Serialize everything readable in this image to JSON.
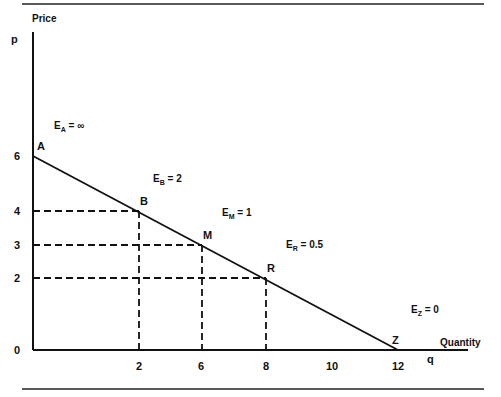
{
  "chart_data": {
    "type": "line",
    "title": "",
    "xlabel": "Quantity",
    "xlabel_symbol": "q",
    "ylabel": "Price",
    "ylabel_symbol": "p",
    "grid": false,
    "x_ticks": [
      {
        "label": "2",
        "slot": 2
      },
      {
        "label": "6",
        "slot": 4
      },
      {
        "label": "8",
        "slot": 6
      },
      {
        "label": "10",
        "slot": 8
      },
      {
        "label": "12",
        "slot": 10
      }
    ],
    "origin_label": "0",
    "y_ticks": [
      {
        "label": "2",
        "value": 2
      },
      {
        "label": "3",
        "value": 3
      },
      {
        "label": "4",
        "value": 4
      },
      {
        "label": "6",
        "value": 6
      }
    ],
    "series": [
      {
        "name": "Linear demand curve",
        "points": [
          {
            "name": "A",
            "x_slot": 0,
            "y": 6
          },
          {
            "name": "Z",
            "x_slot": 10,
            "y": 0
          }
        ]
      }
    ],
    "points": [
      {
        "name": "A",
        "x_slot": 0,
        "y": 6,
        "dashed": false
      },
      {
        "name": "B",
        "x_slot": 2,
        "y": 4,
        "dashed": true
      },
      {
        "name": "M",
        "x_slot": 4,
        "y": 3,
        "dashed": true
      },
      {
        "name": "R",
        "x_slot": 6,
        "y": 2,
        "dashed": true
      },
      {
        "name": "Z",
        "x_slot": 10,
        "y": 0,
        "dashed": false
      }
    ],
    "elasticity_annotations": [
      {
        "point": "A",
        "text_main": "E",
        "subscript": "A",
        "text_value": " = ∞"
      },
      {
        "point": "B",
        "text_main": "E",
        "subscript": "B",
        "text_value": " = 2"
      },
      {
        "point": "M",
        "text_main": "E",
        "subscript": "M",
        "text_value": " = 1"
      },
      {
        "point": "R",
        "text_main": "E",
        "subscript": "R",
        "text_value": " = 0.5"
      },
      {
        "point": "Z",
        "text_main": "E",
        "subscript": "Z",
        "text_value": " = 0"
      }
    ],
    "x_range_slots": [
      0,
      10
    ],
    "y_range": [
      0,
      6
    ]
  }
}
